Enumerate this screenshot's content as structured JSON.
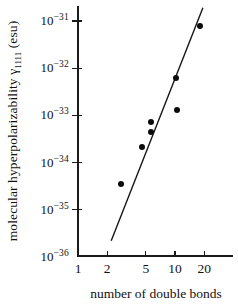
{
  "figure": {
    "background_color": "#ffffff",
    "ink_color": "#111111"
  },
  "chart_data": {
    "type": "scatter",
    "title": "",
    "xlabel": "number of double bonds",
    "ylabel": {
      "pre": "molecular hyperpolarizability γ",
      "sub": "1111",
      "post": " (esu)"
    },
    "x_scale": "log",
    "y_scale": "log",
    "x_ticks": [
      1,
      2,
      5,
      10,
      20
    ],
    "y_tick_exponents": [
      -31,
      -32,
      -33,
      -34,
      -35,
      -36
    ],
    "xlim": [
      1,
      40
    ],
    "ylim": [
      1e-36,
      3e-31
    ],
    "grid": false,
    "legend": "none",
    "marker": "filled-circle",
    "points": [
      {
        "n": 2.8,
        "gamma": 3.5e-35
      },
      {
        "n": 4.6,
        "gamma": 2.1e-34
      },
      {
        "n": 5.7,
        "gamma": 4.4e-34
      },
      {
        "n": 5.7,
        "gamma": 7.1e-34
      },
      {
        "n": 10.5,
        "gamma": 1.3e-33
      },
      {
        "n": 10.2,
        "gamma": 6.3e-33
      },
      {
        "n": 18,
        "gamma": 8e-32
      }
    ],
    "fit_line": {
      "from": {
        "n": 2.2,
        "gamma": 2.2e-36
      },
      "to": {
        "n": 19.4,
        "gamma": 1.9e-31
      }
    }
  }
}
